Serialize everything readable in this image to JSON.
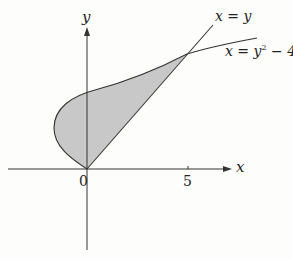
{
  "figure": {
    "axes": {
      "x_label": "x",
      "y_label": "y",
      "origin_label": "0",
      "x_tick_label": "5"
    },
    "curves": [
      {
        "name": "line",
        "label": "x = y"
      },
      {
        "name": "parabola",
        "label_prefix": "x = y",
        "label_exp": "2",
        "label_suffix": " − 4y"
      }
    ],
    "region": {
      "fill": "#c8c8c8",
      "description": "shaded region between x = y and x = y² − 4y"
    },
    "colors": {
      "stroke": "#333333",
      "fill": "#c8c8c8",
      "background": "#fdfdfc"
    }
  }
}
